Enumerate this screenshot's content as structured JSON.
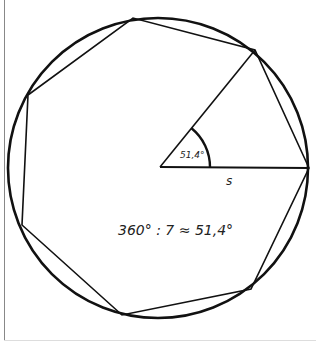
{
  "diagram": {
    "angle_label": "51,4°",
    "side_label": "s",
    "formula": "360° : 7 ≈ 51,4°",
    "vertices": [
      [
        309,
        168
      ],
      [
        255,
        50
      ],
      [
        133,
        18
      ],
      [
        28,
        95
      ],
      [
        22,
        225
      ],
      [
        122,
        315
      ],
      [
        251,
        289
      ]
    ],
    "circle": {
      "cx": 158,
      "cy": 168,
      "r": 150
    },
    "center": [
      160,
      167
    ],
    "line_color": "#111111"
  }
}
